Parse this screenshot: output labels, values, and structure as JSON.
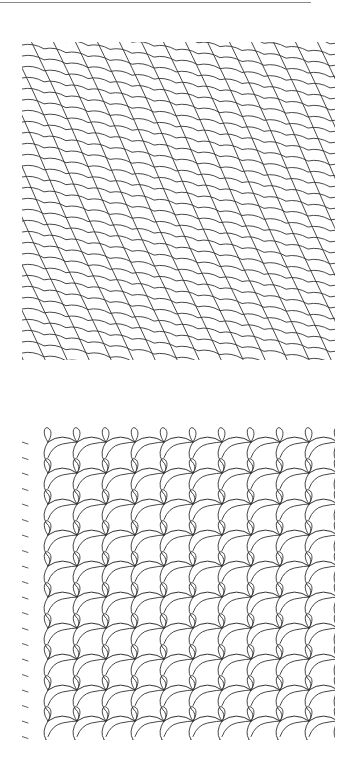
{
  "figure": {
    "background": "#ffffff",
    "top_rule": {
      "x_end": 311,
      "y": 2,
      "color": "#8a8a8a"
    },
    "panels": [
      {
        "name": "diagonal-lattice-pattern",
        "x": 22,
        "y": 42,
        "width": 313,
        "height": 318,
        "stroke": "#333333",
        "line_spacing_x": 22,
        "row_spacing_y": 11,
        "steep_line_slope": 2.2,
        "arc_drop": 7
      },
      {
        "name": "looped-net-pattern",
        "x": 22,
        "y": 420,
        "width": 313,
        "height": 320,
        "stroke": "#333333",
        "column_spacing_x": 29,
        "row_spacing_y": 31,
        "columns": 11,
        "rows": 10
      }
    ]
  }
}
